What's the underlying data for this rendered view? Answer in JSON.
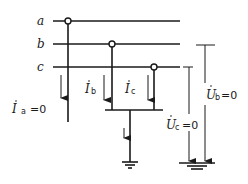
{
  "diagram": {
    "buses": [
      {
        "label": "a"
      },
      {
        "label": "b"
      },
      {
        "label": "c"
      }
    ],
    "currents": {
      "ia": {
        "symbol": "I",
        "sub": "a",
        "value": "=0"
      },
      "ib": {
        "symbol": "I",
        "sub": "b"
      },
      "ic": {
        "symbol": "I",
        "sub": "c"
      }
    },
    "voltages": {
      "uc": {
        "symbol": "U",
        "sub": "c",
        "value": "=0"
      },
      "ub": {
        "symbol": "U",
        "sub": "b",
        "value": "=0"
      }
    },
    "colors": {
      "line": "#1a1a1a",
      "background": "#ffffff"
    }
  }
}
